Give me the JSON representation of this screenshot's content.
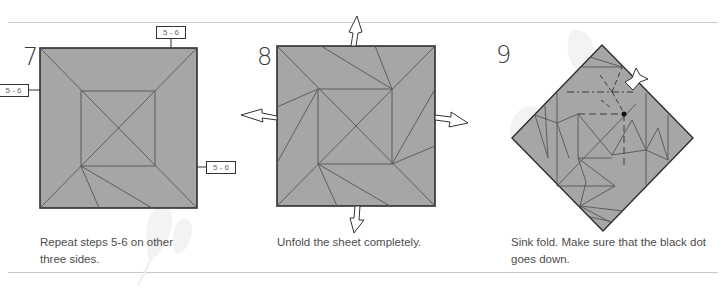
{
  "page": {
    "layout": "origami-instruction-steps",
    "colors": {
      "paper": "#a6a6a6",
      "crease": "#555555",
      "outline": "#2e2e2e",
      "rule": "#c8c8c8",
      "text": "#4d4d4d"
    }
  },
  "steps": [
    {
      "number": "7",
      "caption_line1": "Repeat steps 5-6 on other",
      "caption_line2": "three sides.",
      "ref_labels": [
        "5 - 6",
        "5 - 6",
        "5 - 6"
      ],
      "icons": [
        "reference-label"
      ]
    },
    {
      "number": "8",
      "caption_line1": "Unfold the sheet completely.",
      "icons": [
        "unfold-arrow-up",
        "unfold-arrow-left",
        "unfold-arrow-right",
        "unfold-arrow-down"
      ]
    },
    {
      "number": "9",
      "caption_line1": "Sink fold. Make sure that the black dot",
      "caption_line2": "goes down.",
      "icons": [
        "sink-arrow",
        "black-dot"
      ]
    }
  ]
}
